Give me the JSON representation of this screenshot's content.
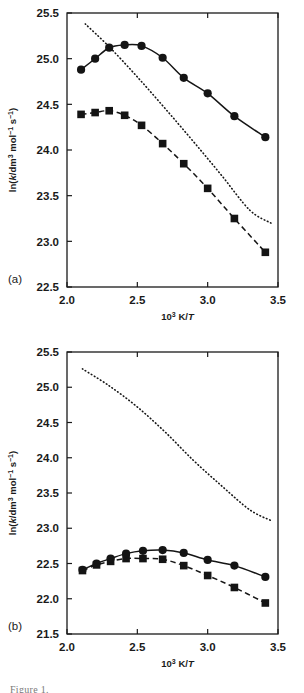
{
  "figure": {
    "axis_x_title": "10³ K/T",
    "axis_y_title": "ln(k/dm³ mol⁻¹ s⁻¹)",
    "panel_a_label": "(a)",
    "panel_b_label": "(b)",
    "caption_fragment": "Figure 1."
  },
  "chart_data": [
    {
      "type": "line",
      "panel": "(a)",
      "title": "",
      "xlabel": "10³ K/T",
      "ylabel": "ln(k/dm³ mol⁻¹ s⁻¹)",
      "xlim": [
        2.0,
        3.5
      ],
      "ylim": [
        22.5,
        25.5
      ],
      "xticks": [
        "2.0",
        "2.5",
        "3.0",
        "3.5"
      ],
      "xtick_values": [
        2.0,
        2.5,
        3.0,
        3.5
      ],
      "yticks": [
        "22.5",
        "23.0",
        "23.5",
        "24.0",
        "24.5",
        "25.0",
        "25.5"
      ],
      "ytick_values": [
        22.5,
        23.0,
        23.5,
        24.0,
        24.5,
        25.0,
        25.5
      ],
      "grid": false,
      "legend": "none",
      "series": [
        {
          "name": "circles-solid",
          "marker": "circle",
          "line_style": "solid",
          "x": [
            2.1,
            2.2,
            2.3,
            2.41,
            2.53,
            2.68,
            2.83,
            3.0,
            3.19,
            3.41
          ],
          "values": [
            24.88,
            25.0,
            25.12,
            25.15,
            25.14,
            25.01,
            24.79,
            24.62,
            24.37,
            24.14
          ]
        },
        {
          "name": "squares-dashed",
          "marker": "square",
          "line_style": "dashed",
          "x": [
            2.1,
            2.2,
            2.3,
            2.41,
            2.53,
            2.68,
            2.83,
            3.0,
            3.19,
            3.41
          ],
          "values": [
            24.39,
            24.41,
            24.43,
            24.38,
            24.27,
            24.07,
            23.85,
            23.58,
            23.25,
            22.88
          ]
        },
        {
          "name": "theory-dotted",
          "marker": "none",
          "line_style": "dotted",
          "x": [
            2.13,
            2.3,
            2.5,
            2.7,
            2.9,
            3.1,
            3.3,
            3.45
          ],
          "values": [
            25.38,
            25.13,
            24.8,
            24.45,
            24.09,
            23.72,
            23.34,
            23.2
          ]
        }
      ]
    },
    {
      "type": "line",
      "panel": "(b)",
      "title": "",
      "xlabel": "10³ K/T",
      "ylabel": "ln(k/dm³ mol⁻¹ s⁻¹)",
      "xlim": [
        2.0,
        3.5
      ],
      "ylim": [
        21.5,
        25.5
      ],
      "xticks": [
        "2.0",
        "2.5",
        "3.0",
        "3.5"
      ],
      "xtick_values": [
        2.0,
        2.5,
        3.0,
        3.5
      ],
      "yticks": [
        "21.5",
        "22.0",
        "22.5",
        "23.0",
        "23.5",
        "24.0",
        "24.5",
        "25.0",
        "25.5"
      ],
      "ytick_values": [
        21.5,
        22.0,
        22.5,
        23.0,
        23.5,
        24.0,
        24.5,
        25.0,
        25.5
      ],
      "grid": false,
      "legend": "none",
      "series": [
        {
          "name": "circles-solid",
          "marker": "circle",
          "line_style": "solid",
          "x": [
            2.11,
            2.21,
            2.31,
            2.42,
            2.54,
            2.68,
            2.83,
            3.0,
            3.19,
            3.41
          ],
          "values": [
            22.41,
            22.5,
            22.57,
            22.64,
            22.68,
            22.69,
            22.65,
            22.55,
            22.47,
            22.31
          ]
        },
        {
          "name": "squares-dashed",
          "marker": "square",
          "line_style": "dashed",
          "x": [
            2.11,
            2.21,
            2.31,
            2.42,
            2.54,
            2.68,
            2.83,
            3.0,
            3.19,
            3.41
          ],
          "values": [
            22.4,
            22.48,
            22.53,
            22.57,
            22.57,
            22.56,
            22.47,
            22.33,
            22.16,
            21.94
          ]
        },
        {
          "name": "theory-dotted",
          "marker": "none",
          "line_style": "dotted",
          "x": [
            2.11,
            2.3,
            2.5,
            2.7,
            2.9,
            3.1,
            3.3,
            3.45
          ],
          "values": [
            25.26,
            25.02,
            24.72,
            24.36,
            23.96,
            23.6,
            23.26,
            23.11
          ]
        }
      ]
    }
  ]
}
